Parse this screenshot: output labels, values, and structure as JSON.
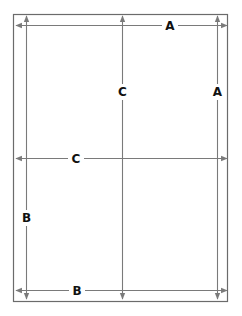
{
  "diagram": {
    "type": "dimension-diagram",
    "colors": {
      "frame": "#6b6b6b",
      "line": "#7a7a7a",
      "arrow": "#7a7a7a",
      "label": "#111111",
      "background": "#ffffff"
    },
    "frame": {
      "x": 13,
      "y": 14,
      "width": 215,
      "height": 288
    },
    "dimensions": [
      {
        "id": "top-A",
        "label": "A",
        "orientation": "horizontal",
        "position": 25,
        "from": 16,
        "to": 227,
        "arrowheads": [
          "start",
          "end"
        ],
        "label_at": 170
      },
      {
        "id": "right-A",
        "label": "A",
        "orientation": "vertical",
        "position": 217,
        "from": 16,
        "to": 299,
        "arrowheads": [
          "start",
          "end"
        ],
        "label_at": 92
      },
      {
        "id": "center-C",
        "label": "C",
        "orientation": "vertical",
        "position": 122,
        "from": 16,
        "to": 299,
        "arrowheads": [
          "start",
          "end"
        ],
        "label_at": 92
      },
      {
        "id": "middle-C",
        "label": "C",
        "orientation": "horizontal",
        "position": 158,
        "from": 16,
        "to": 227,
        "arrowheads": [
          "start",
          "end"
        ],
        "label_at": 76
      },
      {
        "id": "left-B",
        "label": "B",
        "orientation": "vertical",
        "position": 26,
        "from": 16,
        "to": 299,
        "arrowheads": [
          "start",
          "end"
        ],
        "label_at": 218
      },
      {
        "id": "bottom-B",
        "label": "B",
        "orientation": "horizontal",
        "position": 290,
        "from": 16,
        "to": 227,
        "arrowheads": [
          "start",
          "end"
        ],
        "label_at": 77
      }
    ]
  }
}
